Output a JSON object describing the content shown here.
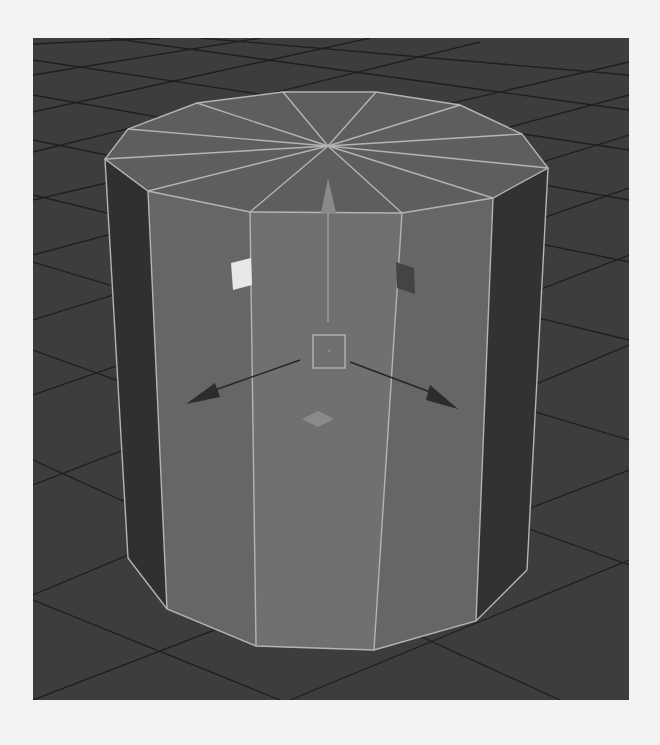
{
  "viewport": {
    "label": "3D viewport - perspective",
    "background": "#3d3d3d",
    "grid_color": "#1e1e1e"
  },
  "object": {
    "type": "polygon cylinder",
    "sides": 12,
    "selected": true,
    "colors": {
      "top_cap": "#5e5e5e",
      "front_face": "#707070",
      "side_face_mid": "#666666",
      "side_face_dark": "#303030",
      "wireframe": "#b4b4b4"
    }
  },
  "manipulator": {
    "type": "move tool",
    "center_handle_color": "#b4b4b4",
    "y_axis_color": "#8a8a8a",
    "x_axis_color": "#2a2a2a",
    "z_axis_color": "#2a2a2a",
    "plane_handle_xy_color": "#e8e8e8",
    "plane_handle_yz_color": "#444444",
    "plane_handle_xz_color": "#8a8a8a"
  }
}
